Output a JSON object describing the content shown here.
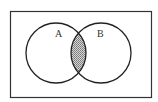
{
  "diagram": {
    "type": "venn",
    "universe": "U",
    "sets": [
      {
        "id": "A",
        "label": "A"
      },
      {
        "id": "B",
        "label": "B"
      }
    ],
    "shaded_region": "A ∩ B",
    "colors": {
      "stroke": "#222222",
      "shade": "#9a9a9a",
      "background": "#ffffff"
    }
  }
}
